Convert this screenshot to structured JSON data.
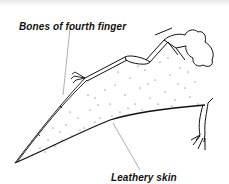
{
  "diagram": {
    "labels": [
      {
        "id": "bones",
        "text": "Bones of fourth finger"
      },
      {
        "id": "skin",
        "text": "Leathery skin"
      }
    ],
    "colors": {
      "ink": "#111111",
      "background": "#ffffff",
      "top_band": "#e6e6e6",
      "leader_line": "#777777"
    }
  }
}
